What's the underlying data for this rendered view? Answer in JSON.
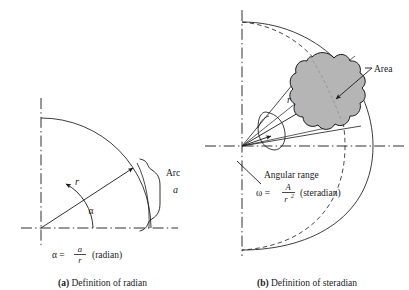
{
  "figure": {
    "kind": "textbook-line-drawing",
    "background_color": "#ffffff",
    "ink_color": "#1a1a1a",
    "blob_fill_color": "#b5b5b5"
  },
  "panel_a": {
    "caption_marker": "(a)",
    "caption_text": " Definition of radian",
    "labels": {
      "radius": "r",
      "angle": "α",
      "arc_word": "Arc",
      "arc_symbol": "a"
    },
    "formula": {
      "lhs": "α =",
      "numerator": "a",
      "denominator": "r",
      "unit": "(radian)"
    }
  },
  "panel_b": {
    "caption_marker": "(b)",
    "caption_text": " Definition of steradian",
    "labels": {
      "radius": "r",
      "area": "Area",
      "angular_range": "Angular range"
    },
    "formula": {
      "lhs": "ω =",
      "numerator": "A",
      "denominator": "r",
      "denominator_exponent": "2",
      "unit": "(steradian)"
    }
  }
}
